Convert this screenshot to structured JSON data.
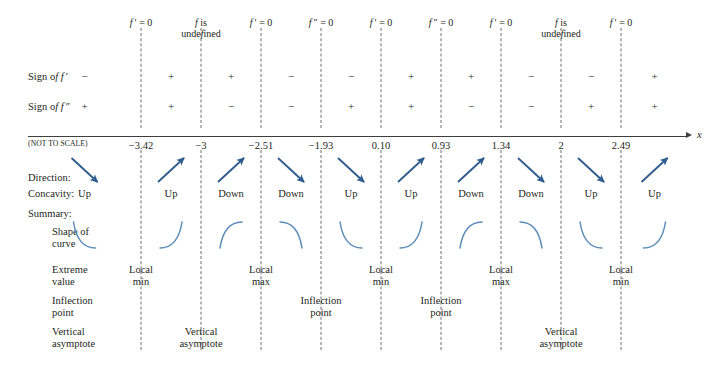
{
  "meta": {
    "scale_note": "(NOT TO SCALE)",
    "axis_label": "x",
    "arrow_color": "#2f5d8e",
    "curve_color": "#5b8db8",
    "axis_color": "#3f3f42",
    "dash_color": "#6e6e72",
    "text_color": "#231f20"
  },
  "row_labels": {
    "sign_fp": "Sign of f ′",
    "sign_fpp": "Sign of f ″",
    "direction": "Direction:",
    "concavity": "Concavity:",
    "summary": "Summary:",
    "shape": "Shape of\ncurve",
    "extreme": "Extreme\nvalue",
    "inflection": "Inflection\npoint",
    "asymptote": "Vertical\nasymptote"
  },
  "chart_data": {
    "type": "table",
    "xlabel": "x",
    "grid": false,
    "legend": null,
    "note": "(NOT TO SCALE)",
    "critical_points": [
      {
        "value": "−3.42",
        "header": "f ′ = 0",
        "header_type": "fp-zero",
        "extreme": "Local\nmin",
        "inflection": "",
        "asymptote": ""
      },
      {
        "value": "−3",
        "header": "f is\nundefined",
        "header_type": "f-undefined",
        "extreme": "",
        "inflection": "",
        "asymptote": "Vertical\nasymptote"
      },
      {
        "value": "−2.51",
        "header": "f ′ = 0",
        "header_type": "fp-zero",
        "extreme": "Local\nmax",
        "inflection": "",
        "asymptote": ""
      },
      {
        "value": "−1.93",
        "header": "f ″ = 0",
        "header_type": "fpp-zero",
        "extreme": "",
        "inflection": "Inflection\npoint",
        "asymptote": ""
      },
      {
        "value": "0.10",
        "header": "f ′ = 0",
        "header_type": "fp-zero",
        "extreme": "Local\nmin",
        "inflection": "",
        "asymptote": ""
      },
      {
        "value": "0.93",
        "header": "f ″ = 0",
        "header_type": "fpp-zero",
        "extreme": "",
        "inflection": "Inflection\npoint",
        "asymptote": ""
      },
      {
        "value": "1.34",
        "header": "f ′ = 0",
        "header_type": "fp-zero",
        "extreme": "Local\nmax",
        "inflection": "",
        "asymptote": ""
      },
      {
        "value": "2",
        "header": "f is\nundefined",
        "header_type": "f-undefined",
        "extreme": "",
        "inflection": "",
        "asymptote": "Vertical\nasymptote"
      },
      {
        "value": "2.49",
        "header": "f ′ = 0",
        "header_type": "fp-zero",
        "extreme": "Local\nmin",
        "inflection": "",
        "asymptote": ""
      }
    ],
    "intervals": [
      {
        "sign_fp": "−",
        "sign_fpp": "+",
        "direction": "down",
        "concavity": "Up"
      },
      {
        "sign_fp": "+",
        "sign_fpp": "+",
        "direction": "up",
        "concavity": "Up"
      },
      {
        "sign_fp": "+",
        "sign_fpp": "−",
        "direction": "up",
        "concavity": "Down"
      },
      {
        "sign_fp": "−",
        "sign_fpp": "−",
        "direction": "down",
        "concavity": "Down"
      },
      {
        "sign_fp": "−",
        "sign_fpp": "+",
        "direction": "down",
        "concavity": "Up"
      },
      {
        "sign_fp": "+",
        "sign_fpp": "+",
        "direction": "up",
        "concavity": "Up"
      },
      {
        "sign_fp": "+",
        "sign_fpp": "−",
        "direction": "up",
        "concavity": "Down"
      },
      {
        "sign_fp": "−",
        "sign_fpp": "−",
        "direction": "down",
        "concavity": "Down"
      },
      {
        "sign_fp": "−",
        "sign_fpp": "+",
        "direction": "down",
        "concavity": "Up"
      },
      {
        "sign_fp": "+",
        "sign_fpp": "+",
        "direction": "up",
        "concavity": "Up"
      }
    ],
    "axis": {
      "tick_x_px": [
        141,
        201,
        261,
        321,
        381,
        441,
        501,
        561,
        621
      ],
      "left_px": 28,
      "right_px": 688,
      "y_px": 136
    }
  }
}
